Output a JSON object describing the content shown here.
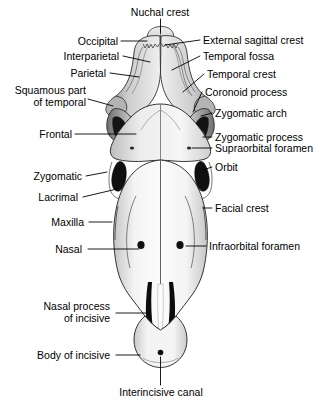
{
  "figure": {
    "type": "anatomical-diagram",
    "view": "dorsal",
    "background_color": "#ffffff",
    "line_color": "#000000",
    "bone_fill_light": "#f2f2f2",
    "bone_fill_mid": "#c9c9c9",
    "bone_fill_dark": "#8e8e8e",
    "cavity_color": "#111111"
  },
  "labels": [
    {
      "id": "nuchal-crest",
      "text": "Nuchal crest",
      "align": "center"
    },
    {
      "id": "occipital",
      "text": "Occipital",
      "align": "right"
    },
    {
      "id": "external-sagittal-crest",
      "text": "External sagittal crest",
      "align": "left"
    },
    {
      "id": "interparietal",
      "text": "Interparietal",
      "align": "right"
    },
    {
      "id": "temporal-fossa",
      "text": "Temporal fossa",
      "align": "left"
    },
    {
      "id": "parietal",
      "text": "Parietal",
      "align": "right"
    },
    {
      "id": "temporal-crest",
      "text": "Temporal crest",
      "align": "left"
    },
    {
      "id": "squamous-part-of-temporal",
      "text": "Squamous part\nof temporal",
      "align": "right"
    },
    {
      "id": "coronoid-process",
      "text": "Coronoid process",
      "align": "left"
    },
    {
      "id": "zygomatic-arch",
      "text": "Zygomatic arch",
      "align": "left"
    },
    {
      "id": "frontal",
      "text": "Frontal",
      "align": "right"
    },
    {
      "id": "zygomatic-process",
      "text": "Zygomatic process",
      "align": "left"
    },
    {
      "id": "supraorbital-foramen",
      "text": "Supraorbital foramen",
      "align": "left"
    },
    {
      "id": "zygomatic",
      "text": "Zygomatic",
      "align": "right"
    },
    {
      "id": "orbit",
      "text": "Orbit",
      "align": "left"
    },
    {
      "id": "lacrimal",
      "text": "Lacrimal",
      "align": "right"
    },
    {
      "id": "facial-crest",
      "text": "Facial crest",
      "align": "left"
    },
    {
      "id": "maxilla",
      "text": "Maxilla",
      "align": "right"
    },
    {
      "id": "nasal",
      "text": "Nasal",
      "align": "right"
    },
    {
      "id": "infraorbital-foramen",
      "text": "Infraorbital foramen",
      "align": "left"
    },
    {
      "id": "nasal-process-of-incisive",
      "text": "Nasal process\nof incisive",
      "align": "right"
    },
    {
      "id": "body-of-incisive",
      "text": "Body of incisive",
      "align": "right"
    },
    {
      "id": "interincisive-canal",
      "text": "Interincisive canal",
      "align": "center"
    }
  ]
}
